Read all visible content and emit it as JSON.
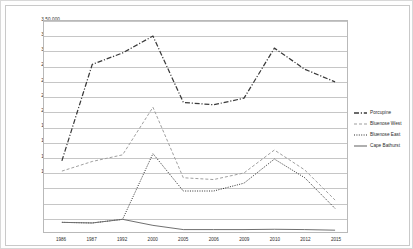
{
  "chart_data": {
    "type": "line",
    "title": "",
    "xlabel": "",
    "ylabel": "",
    "categories": [
      "1986",
      "1987",
      "1992",
      "2000",
      "2005",
      "2006",
      "2009",
      "2010",
      "2012",
      "2015"
    ],
    "ylim": [
      0,
      350000
    ],
    "ytick_labels": [
      "25,000",
      "50,000",
      "75,000",
      "1,00,000",
      "1,25,000",
      "1,50,000",
      "1,75,000",
      "2,00,000",
      "2,25,000",
      "2,50,000",
      "2,75,000",
      "3,00,000",
      "3,25,000",
      "3,50,000"
    ],
    "ytick_values": [
      25000,
      50000,
      75000,
      100000,
      125000,
      150000,
      175000,
      200000,
      225000,
      250000,
      275000,
      300000,
      325000,
      350000
    ],
    "grid": true,
    "legend_position": "right",
    "series": [
      {
        "name": "Porcupine",
        "style": "dash-dot",
        "color": "#3a3a3a",
        "values": [
          118000,
          278000,
          297000,
          325000,
          215000,
          211000,
          222000,
          305000,
          270000,
          249000
        ]
      },
      {
        "name": "Bluenose West",
        "style": "dashed",
        "color": "#9e9e9e",
        "values": [
          101000,
          117000,
          128000,
          207000,
          90000,
          87000,
          98000,
          136000,
          103000,
          53000
        ]
      },
      {
        "name": "Bluenose East",
        "style": "dotted",
        "color": "#2a2a2a",
        "values": [
          16000,
          15000,
          21000,
          130000,
          68000,
          68000,
          81000,
          121000,
          90000,
          39000
        ]
      },
      {
        "name": "Cape Bathurst",
        "style": "solid",
        "color": "#6e6e6e",
        "values": [
          16000,
          15000,
          21000,
          11000,
          4000,
          4000,
          4000,
          4500,
          4000,
          3000
        ]
      }
    ]
  }
}
